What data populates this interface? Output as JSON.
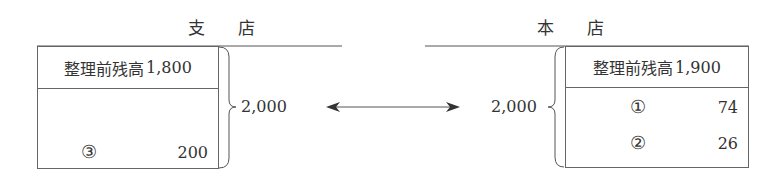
{
  "branch": {
    "title": "支店",
    "title_display": "支 店",
    "opening_label": "整理前残高",
    "opening_amount": "1,800",
    "entries": [
      {
        "marker": "③",
        "amount": "200"
      }
    ],
    "total": "2,000"
  },
  "head_office": {
    "title": "本店",
    "title_display": "本 店",
    "opening_label": "整理前残高",
    "opening_amount": "1,900",
    "entries": [
      {
        "marker": "①",
        "amount": "74"
      },
      {
        "marker": "②",
        "amount": "26"
      }
    ],
    "total": "2,000"
  },
  "connector": {
    "type": "double-arrow",
    "meaning": "balances agree"
  }
}
